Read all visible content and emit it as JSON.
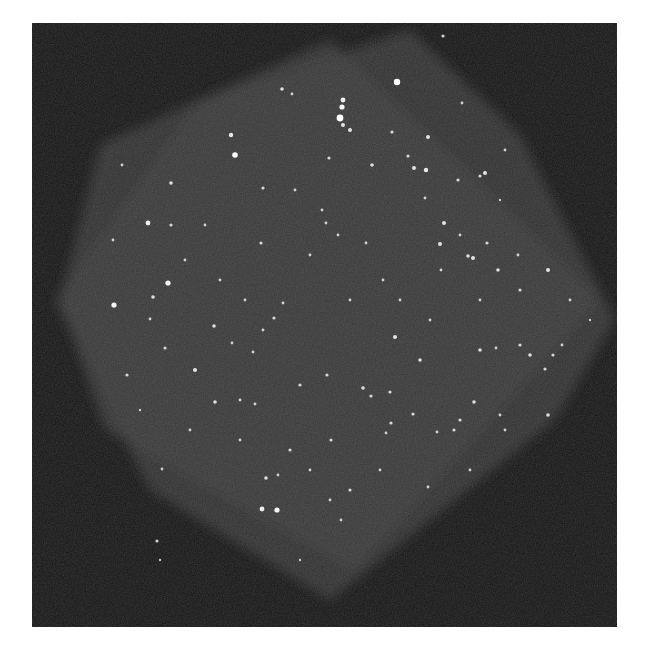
{
  "image": {
    "subject": "astronomical survey mosaic of a star field",
    "frame": {
      "x": 32,
      "y": 23,
      "width": 585,
      "height": 604,
      "color": "#141414"
    },
    "field_color": "#3a3a3a",
    "field_edge_color": "#2c2c2c",
    "star_color": "#ffffff",
    "fields": [
      {
        "name": "exposure-a",
        "points": [
          [
            100,
            145
          ],
          [
            330,
            40
          ],
          [
            600,
            300
          ],
          [
            355,
            570
          ],
          [
            105,
            430
          ],
          [
            60,
            300
          ]
        ]
      },
      {
        "name": "exposure-b",
        "points": [
          [
            200,
            100
          ],
          [
            410,
            30
          ],
          [
            520,
            135
          ],
          [
            615,
            320
          ],
          [
            555,
            420
          ],
          [
            330,
            600
          ],
          [
            150,
            490
          ],
          [
            55,
            300
          ]
        ]
      }
    ],
    "stars": [
      [
        397,
        82,
        3.2
      ],
      [
        343,
        100,
        2.4
      ],
      [
        342,
        107,
        2.6
      ],
      [
        340,
        118,
        3.4
      ],
      [
        343,
        125,
        2.0
      ],
      [
        350,
        130,
        2.0
      ],
      [
        231,
        135,
        2.2
      ],
      [
        235,
        155,
        2.8
      ],
      [
        329,
        158,
        1.6
      ],
      [
        392,
        132,
        1.6
      ],
      [
        428,
        137,
        2.0
      ],
      [
        372,
        165,
        1.8
      ],
      [
        408,
        156,
        1.6
      ],
      [
        414,
        168,
        2.0
      ],
      [
        426,
        170,
        2.2
      ],
      [
        485,
        173,
        2.0
      ],
      [
        480,
        176,
        1.6
      ],
      [
        458,
        180,
        1.6
      ],
      [
        425,
        198,
        1.4
      ],
      [
        444,
        223,
        2.0
      ],
      [
        171,
        183,
        1.8
      ],
      [
        148,
        223,
        2.4
      ],
      [
        171,
        225,
        1.6
      ],
      [
        263,
        188,
        1.6
      ],
      [
        261,
        243,
        1.6
      ],
      [
        295,
        190,
        1.4
      ],
      [
        322,
        210,
        1.4
      ],
      [
        326,
        223,
        1.4
      ],
      [
        338,
        235,
        1.4
      ],
      [
        366,
        243,
        1.4
      ],
      [
        440,
        244,
        2.0
      ],
      [
        468,
        256,
        1.8
      ],
      [
        473,
        258,
        2.0
      ],
      [
        487,
        243,
        1.6
      ],
      [
        518,
        255,
        1.4
      ],
      [
        498,
        270,
        1.8
      ],
      [
        520,
        290,
        1.6
      ],
      [
        548,
        270,
        2.0
      ],
      [
        441,
        270,
        1.4
      ],
      [
        383,
        280,
        1.4
      ],
      [
        168,
        283,
        2.6
      ],
      [
        153,
        297,
        1.8
      ],
      [
        114,
        305,
        2.6
      ],
      [
        150,
        319,
        1.4
      ],
      [
        214,
        326,
        1.8
      ],
      [
        232,
        343,
        1.4
      ],
      [
        253,
        352,
        1.4
      ],
      [
        274,
        318,
        1.6
      ],
      [
        283,
        303,
        1.4
      ],
      [
        263,
        330,
        1.4
      ],
      [
        195,
        370,
        2.0
      ],
      [
        165,
        348,
        1.6
      ],
      [
        215,
        402,
        1.8
      ],
      [
        240,
        400,
        1.4
      ],
      [
        255,
        404,
        1.4
      ],
      [
        278,
        475,
        1.4
      ],
      [
        290,
        450,
        1.6
      ],
      [
        300,
        385,
        1.6
      ],
      [
        327,
        375,
        1.6
      ],
      [
        331,
        440,
        1.6
      ],
      [
        363,
        388,
        1.8
      ],
      [
        390,
        392,
        1.6
      ],
      [
        371,
        396,
        1.6
      ],
      [
        395,
        337,
        2.0
      ],
      [
        420,
        360,
        1.8
      ],
      [
        391,
        423,
        1.6
      ],
      [
        413,
        414,
        1.6
      ],
      [
        437,
        432,
        1.4
      ],
      [
        454,
        430,
        1.6
      ],
      [
        460,
        420,
        1.6
      ],
      [
        474,
        402,
        1.8
      ],
      [
        480,
        350,
        1.8
      ],
      [
        520,
        345,
        1.6
      ],
      [
        530,
        355,
        1.8
      ],
      [
        545,
        369,
        1.6
      ],
      [
        553,
        355,
        1.6
      ],
      [
        562,
        345,
        1.4
      ],
      [
        548,
        415,
        1.8
      ],
      [
        505,
        430,
        1.4
      ],
      [
        496,
        348,
        1.4
      ],
      [
        500,
        415,
        1.4
      ],
      [
        428,
        487,
        1.4
      ],
      [
        386,
        433,
        1.4
      ],
      [
        350,
        490,
        1.6
      ],
      [
        341,
        520,
        1.4
      ],
      [
        262,
        509,
        2.4
      ],
      [
        277,
        510,
        2.6
      ],
      [
        266,
        478,
        1.8
      ],
      [
        310,
        470,
        1.4
      ],
      [
        330,
        500,
        1.4
      ],
      [
        127,
        375,
        1.6
      ],
      [
        162,
        469,
        1.4
      ],
      [
        157,
        541,
        1.6
      ],
      [
        160,
        560,
        1.2
      ],
      [
        282,
        89,
        1.8
      ],
      [
        292,
        94,
        1.4
      ],
      [
        443,
        36,
        1.6
      ],
      [
        462,
        103,
        1.4
      ],
      [
        505,
        150,
        1.4
      ],
      [
        480,
        300,
        1.4
      ],
      [
        113,
        240,
        1.4
      ],
      [
        122,
        165,
        1.4
      ],
      [
        185,
        260,
        1.4
      ],
      [
        220,
        280,
        1.4
      ],
      [
        245,
        300,
        1.4
      ],
      [
        205,
        225,
        1.4
      ],
      [
        310,
        255,
        1.4
      ],
      [
        350,
        300,
        1.4
      ],
      [
        400,
        300,
        1.4
      ],
      [
        430,
        320,
        1.4
      ],
      [
        470,
        470,
        1.4
      ],
      [
        380,
        470,
        1.4
      ],
      [
        240,
        440,
        1.4
      ],
      [
        190,
        430,
        1.4
      ],
      [
        140,
        410,
        1.2
      ],
      [
        300,
        560,
        1.2
      ],
      [
        460,
        235,
        1.4
      ],
      [
        500,
        200,
        1.2
      ],
      [
        570,
        300,
        1.4
      ],
      [
        590,
        320,
        1.2
      ]
    ]
  }
}
